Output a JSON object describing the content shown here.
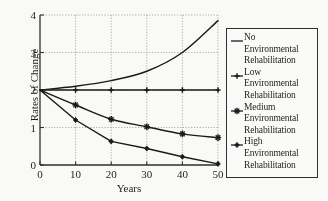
{
  "chart_data": {
    "type": "line",
    "title": "",
    "xlabel": "Years",
    "ylabel": "Rates of Change",
    "x": [
      0,
      10,
      20,
      30,
      40,
      50
    ],
    "xlim": [
      0,
      50
    ],
    "ylim": [
      0,
      4
    ],
    "xticks": [
      "0",
      "10",
      "20",
      "30",
      "40",
      "50"
    ],
    "yticks": [
      "0",
      "1",
      "2",
      "3",
      "4"
    ],
    "grid": true,
    "legend_position": "right",
    "series": [
      {
        "name": "No Environmental Rehabilitation",
        "marker": "none",
        "values": [
          2.0,
          2.1,
          2.25,
          2.5,
          3.0,
          3.85
        ]
      },
      {
        "name": "Low Environmental Rehabilitation",
        "marker": "plus",
        "values": [
          2.0,
          2.0,
          2.0,
          2.0,
          2.0,
          2.0
        ]
      },
      {
        "name": "Medium Environmental Rehabilitation",
        "marker": "star",
        "values": [
          2.0,
          1.6,
          1.22,
          1.02,
          0.83,
          0.73
        ]
      },
      {
        "name": "High Environmental Rehabilitation",
        "marker": "diamond",
        "values": [
          2.0,
          1.2,
          0.63,
          0.44,
          0.22,
          0.03
        ]
      }
    ]
  },
  "axes": {
    "ylabel": "Rates of Change",
    "xlabel": "Years",
    "yticks": [
      "4",
      "3",
      "2",
      "1",
      "0"
    ],
    "xticks": [
      "0",
      "10",
      "20",
      "30",
      "40",
      "50"
    ]
  },
  "legend": {
    "entries": [
      {
        "marker": "none",
        "line1": "No",
        "line2": "Environmental",
        "line3": "Rehabilitation"
      },
      {
        "marker": "plus",
        "line1": "Low",
        "line2": "Environmental",
        "line3": "Rehabilitation"
      },
      {
        "marker": "star",
        "line1": "Medium",
        "line2": "Environmental",
        "line3": "Rehabilitation"
      },
      {
        "marker": "diamond",
        "line1": "High",
        "line2": "Environmental",
        "line3": "Rehabilitation"
      }
    ]
  },
  "colors": {
    "line": "#161616",
    "grid": "#9a9a9a",
    "axis": "#2b2b2b",
    "background": "#fbfbf9"
  }
}
